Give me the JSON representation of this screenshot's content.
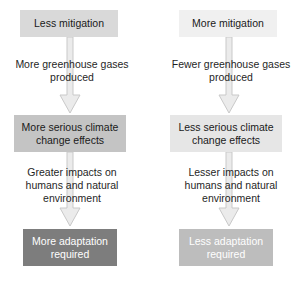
{
  "diagram": {
    "background_color": "#ffffff",
    "arrow_fill": "#ebebeb",
    "arrow_stroke": "#c9c9c9"
  },
  "columns": [
    {
      "id": "less-mitigation",
      "top_box": {
        "label": "Less mitigation",
        "fill": "#d9d9d9",
        "text_color": "#1a1a1a"
      },
      "caption_1": {
        "lines": [
          "More greenhouse gases",
          "produced"
        ]
      },
      "mid_box": {
        "label_lines": [
          "More serious climate",
          "change effects"
        ],
        "fill": "#c4c4c4",
        "text_color": "#1a1a1a"
      },
      "caption_2": {
        "lines": [
          "Greater impacts on",
          "humans and natural",
          "environment"
        ]
      },
      "bottom_box": {
        "label_lines": [
          "More adaptation",
          "required"
        ],
        "fill": "#7d7d7d",
        "text_color": "#ffffff"
      }
    },
    {
      "id": "more-mitigation",
      "top_box": {
        "label": "More mitigation",
        "fill": "#f0f0f0",
        "text_color": "#1a1a1a"
      },
      "caption_1": {
        "lines": [
          "Fewer greenhouse gases",
          "produced"
        ]
      },
      "mid_box": {
        "label_lines": [
          "Less serious climate",
          "change effects"
        ],
        "fill": "#e6e6e6",
        "text_color": "#1a1a1a"
      },
      "caption_2": {
        "lines": [
          "Lesser impacts on",
          "humans and natural",
          "environment"
        ]
      },
      "bottom_box": {
        "label_lines": [
          "Less adaptation",
          "required"
        ],
        "fill": "#bdbdbd",
        "text_color": "#ffffff"
      }
    }
  ]
}
